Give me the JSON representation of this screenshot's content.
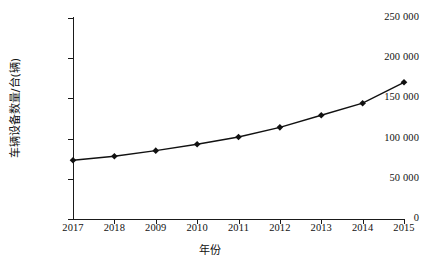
{
  "chart_data": {
    "type": "line",
    "title": "",
    "xlabel": "年份",
    "ylabel": "车辆设备数量/台(辆)",
    "categories": [
      "2017",
      "2018",
      "2009",
      "2010",
      "2011",
      "2012",
      "2013",
      "2014",
      "2015"
    ],
    "values": [
      73000,
      78000,
      85000,
      93000,
      102000,
      114000,
      129000,
      144000,
      170000
    ],
    "series": [
      {
        "name": "车辆设备数量",
        "values": [
          73000,
          78000,
          85000,
          93000,
          102000,
          114000,
          129000,
          144000,
          170000
        ]
      }
    ],
    "ylim": [
      0,
      250000
    ],
    "yticks": [
      0,
      50000,
      100000,
      150000,
      200000,
      250000
    ],
    "ytick_labels": [
      "0",
      "50 000",
      "100 000",
      "150 000",
      "200 000",
      "250 000"
    ],
    "grid": false,
    "legend": null,
    "marker": "diamond",
    "line_color": "#111111",
    "marker_color": "#111111"
  },
  "axes": {
    "x_title": "年份",
    "y_title": "车辆设备数量/台(辆)"
  }
}
